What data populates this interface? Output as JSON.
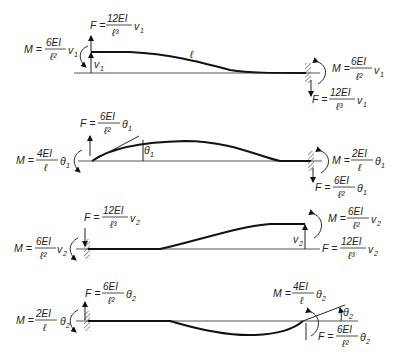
{
  "figure": {
    "length_label": "ℓ",
    "cases": [
      {
        "id": "v1",
        "left": {
          "F": {
            "lhs": "F =",
            "num": "12EI",
            "den": "ℓ³",
            "var": "v",
            "sub": "1"
          },
          "M": {
            "lhs": "M =",
            "num": "6EI",
            "den": "ℓ²",
            "var": "v",
            "sub": "1"
          },
          "disp_label": {
            "var": "v",
            "sub": "1"
          }
        },
        "right": {
          "M": {
            "lhs": "M =",
            "num": "6EI",
            "den": "ℓ²",
            "var": "v",
            "sub": "1"
          },
          "F": {
            "lhs": "F =",
            "num": "12EI",
            "den": "ℓ³",
            "var": "v",
            "sub": "1"
          }
        }
      },
      {
        "id": "theta1",
        "left": {
          "F": {
            "lhs": "F =",
            "num": "6EI",
            "den": "ℓ²",
            "var": "θ",
            "sub": "1"
          },
          "M": {
            "lhs": "M =",
            "num": "4EI",
            "den": "ℓ",
            "var": "θ",
            "sub": "1"
          },
          "angle_label": {
            "var": "θ",
            "sub": "1"
          }
        },
        "right": {
          "M": {
            "lhs": "M =",
            "num": "2EI",
            "den": "ℓ",
            "var": "θ",
            "sub": "1"
          },
          "F": {
            "lhs": "F =",
            "num": "6EI",
            "den": "ℓ²",
            "var": "θ",
            "sub": "1"
          }
        }
      },
      {
        "id": "v2",
        "left": {
          "F": {
            "lhs": "F =",
            "num": "12EI",
            "den": "ℓ³",
            "var": "v",
            "sub": "2"
          },
          "M": {
            "lhs": "M =",
            "num": "6EI",
            "den": "ℓ²",
            "var": "v",
            "sub": "2"
          }
        },
        "right": {
          "M": {
            "lhs": "M =",
            "num": "6EI",
            "den": "ℓ²",
            "var": "v",
            "sub": "2"
          },
          "F": {
            "lhs": "F =",
            "num": "12EI",
            "den": "ℓ³",
            "var": "v",
            "sub": "2"
          },
          "disp_label": {
            "var": "v",
            "sub": "2"
          }
        }
      },
      {
        "id": "theta2",
        "left": {
          "F": {
            "lhs": "F =",
            "num": "6EI",
            "den": "ℓ²",
            "var": "θ",
            "sub": "2"
          },
          "M": {
            "lhs": "M =",
            "num": "2EI",
            "den": "ℓ",
            "var": "θ",
            "sub": "2"
          }
        },
        "right": {
          "M": {
            "lhs": "M =",
            "num": "4EI",
            "den": "ℓ",
            "var": "θ",
            "sub": "2"
          },
          "F": {
            "lhs": "F =",
            "num": "6EI",
            "den": "ℓ²",
            "var": "θ",
            "sub": "2"
          },
          "angle_label": {
            "var": "θ",
            "sub": "2"
          }
        }
      }
    ]
  }
}
